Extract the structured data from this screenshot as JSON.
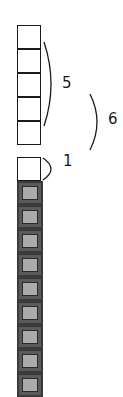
{
  "diagram": {
    "white_stack": {
      "count": 5,
      "top": 25,
      "box_size": 24
    },
    "single_white_box": {
      "top": 157
    },
    "dark_stack": {
      "count": 9,
      "top": 181,
      "box_size": 24
    },
    "colors": {
      "outline": "#1a1a1a",
      "dark_border": "#3a3a3a",
      "dark_fill": "#5a5a5a",
      "inner_fill": "#ababab"
    }
  },
  "labels": {
    "brace_5": "5",
    "brace_6": "6",
    "brace_1": "1"
  }
}
